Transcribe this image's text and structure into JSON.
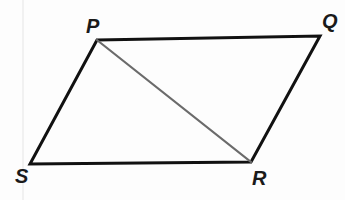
{
  "figure": {
    "name": "parallelogram-pqrs",
    "type": "geometry-diagram",
    "background_color": "#fdfdfd",
    "outline_color": "#111111",
    "outline_width": 3,
    "diagonal_color": "#6b6b6b",
    "diagonal_width": 2,
    "label_color": "#1a1a1a",
    "vertices": [
      {
        "id": "P",
        "label": "P",
        "x": 97,
        "y": 40,
        "label_x": 86,
        "label_y": 16
      },
      {
        "id": "Q",
        "label": "Q",
        "x": 320,
        "y": 36,
        "label_x": 322,
        "label_y": 11
      },
      {
        "id": "R",
        "label": "R",
        "x": 251,
        "y": 162,
        "label_x": 252,
        "label_y": 168
      },
      {
        "id": "S",
        "label": "S",
        "x": 30,
        "y": 164,
        "label_x": 15,
        "label_y": 166
      }
    ],
    "sides": [
      {
        "id": "PQ",
        "from": "P",
        "to": "Q"
      },
      {
        "id": "QR",
        "from": "Q",
        "to": "R"
      },
      {
        "id": "RS",
        "from": "R",
        "to": "S"
      },
      {
        "id": "SP",
        "from": "S",
        "to": "P"
      }
    ],
    "diagonals": [
      {
        "id": "PR",
        "from": "P",
        "to": "R"
      }
    ],
    "outline_path": "M 97 40 L 320 36 L 251 162 L 30 164 Z",
    "diagonal_path": "M 97 40 L 251 162",
    "artifact_streak_x": 22
  }
}
